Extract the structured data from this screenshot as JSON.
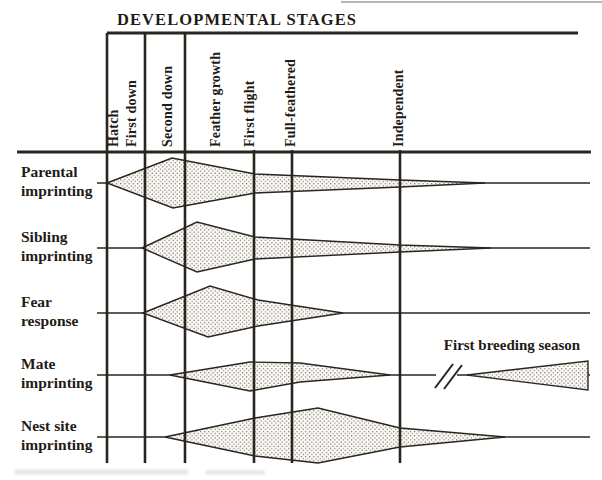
{
  "figure": {
    "title": "DEVELOPMENTAL STAGES",
    "annotation_first_breeding": "First breeding season",
    "colors": {
      "ink": "#29251f",
      "label_text": "#1f1b16",
      "shape_fill": "#fcfaf6",
      "stipple_dot": "#5a544c",
      "artifact_gray": "#9c9c9c"
    },
    "layout": {
      "top_rule": {
        "x1": 107,
        "y": 33,
        "x2": 578
      },
      "header_rule": {
        "x1": 17,
        "y": 152,
        "x2": 591
      },
      "artifact_line": {
        "x1": 341,
        "y": 2,
        "x2": 602
      },
      "grid_top_major_y": 33,
      "grid_top_minor_y": 150,
      "grid_bottom_y": 463,
      "label_baseline_y": 147,
      "row_label_x": 21
    },
    "major_stage_lines_x": [
      107,
      145,
      185
    ],
    "minor_stage_lines_x": [
      254,
      292,
      400
    ],
    "stages": [
      {
        "label": "Hatch",
        "x": 113
      },
      {
        "label": "First down",
        "x": 131
      },
      {
        "label": "Second down",
        "x": 167
      },
      {
        "label": "Feather growth",
        "x": 215
      },
      {
        "label": "First flight",
        "x": 249
      },
      {
        "label": "Full-feathered",
        "x": 290
      },
      {
        "label": "Independent",
        "x": 398
      }
    ],
    "rows": [
      {
        "name": "parental-imprinting",
        "label_lines": [
          "Parental",
          "imprinting"
        ],
        "y": 183,
        "line_segments": [
          [
            97,
            590
          ]
        ]
      },
      {
        "name": "sibling-imprinting",
        "label_lines": [
          "Sibling",
          "imprinting"
        ],
        "y": 248,
        "line_segments": [
          [
            97,
            590
          ]
        ]
      },
      {
        "name": "fear-response",
        "label_lines": [
          "Fear",
          "response"
        ],
        "y": 313,
        "line_segments": [
          [
            97,
            590
          ]
        ]
      },
      {
        "name": "mate-imprinting",
        "label_lines": [
          "Mate",
          "imprinting"
        ],
        "y": 375,
        "line_segments": [
          [
            97,
            436
          ],
          [
            457,
            590
          ]
        ],
        "break_marks": [
          [
            435,
            388,
            453,
            364
          ],
          [
            444,
            389,
            462,
            365
          ]
        ]
      },
      {
        "name": "nest-site-imprinting",
        "label_lines": [
          "Nest site",
          "imprinting"
        ],
        "y": 437,
        "line_segments": [
          [
            97,
            590
          ]
        ]
      }
    ],
    "shapes": [
      {
        "name": "parental-imprinting-period",
        "points": "107,183 172,158 255,174 400,180 485,183 400,187 255,193 173,208"
      },
      {
        "name": "sibling-imprinting-period",
        "points": "142,248 197,222 255,237 400,245 491,248 400,252 255,259 197,272"
      },
      {
        "name": "fear-response-period",
        "points": "143,313 210,286 258,300 343,313 258,326 208,337"
      },
      {
        "name": "mate-imprinting-early-period",
        "points": "170,375 250,362 300,363 390,375 300,382 250,391"
      },
      {
        "name": "mate-imprinting-breeding-period",
        "points": "467,375 588,361 588,390"
      },
      {
        "name": "nest-site-imprinting-period",
        "points": "165,437 255,418 318,408 400,428 505,437 400,447 318,463 255,456"
      }
    ]
  }
}
